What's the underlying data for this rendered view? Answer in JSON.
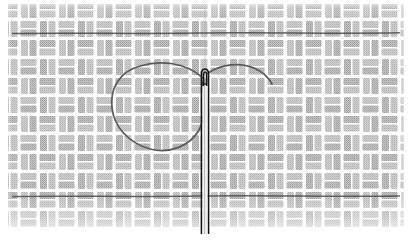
{
  "figure": {
    "caption": "",
    "width": 412,
    "height": 241,
    "background_color": "#ffffff"
  },
  "fabric": {
    "name": "basketweave-fabric",
    "weave_color": "#b9b9b9",
    "weave_color_light": "#cfcfcf",
    "gap_color": "#ffffff",
    "cell_size": 19,
    "bounds": {
      "x": 10,
      "y": 6,
      "width": 390,
      "height": 222
    },
    "fade_bottom": true,
    "description": "Plain basketweave / tabby weave texture of stacked horizontal and vertical thread bundles"
  },
  "guide_threads": [
    {
      "name": "upper-guide-thread",
      "y": 33,
      "x1": 12,
      "x2": 400,
      "color": "#4a4a4a"
    },
    {
      "name": "lower-guide-thread",
      "y": 196,
      "x1": 12,
      "x2": 400,
      "color": "#4a4a4a"
    }
  ],
  "needle": {
    "name": "sewing-needle",
    "color": "#1a1a1a",
    "shaft_x": 205,
    "top_y": 60,
    "bottom_y": 232,
    "width": 7,
    "eye": {
      "name": "needle-eye",
      "center_x": 205,
      "top_y": 63,
      "bottom_y": 89,
      "outer_width": 13,
      "inner_width": 5
    }
  },
  "thread": {
    "name": "embroidery-thread",
    "color": "#5a5a5a",
    "stroke_width": 1.6,
    "loop": {
      "name": "thread-loop",
      "shape": "teardrop",
      "left_extent_x": 112,
      "top_y": 66,
      "bottom_y": 150,
      "anchor_x": 203,
      "anchor_y": 77
    },
    "tail": {
      "name": "thread-tail",
      "start_x": 207,
      "start_y": 72,
      "end_x": 272,
      "end_y": 83,
      "description": "Free end of thread curving up and to the right from the needle eye"
    }
  },
  "labels": {
    "figure_label": "",
    "needle_label": "",
    "thread_label": ""
  }
}
